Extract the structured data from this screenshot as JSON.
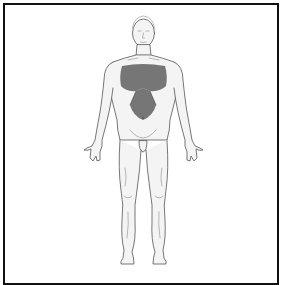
{
  "diagram": {
    "type": "anatomical-body-chart",
    "view": "anterior",
    "highlighted_regions": [
      {
        "name": "chest",
        "description": "shaded across upper anterior chest between shoulders"
      },
      {
        "name": "epigastric-upper-abdomen",
        "description": "shaded triangular extension down the midline to the umbilicus"
      }
    ],
    "colors": {
      "frame": "#111111",
      "background": "#ffffff",
      "body_fill": "#f4f4f4",
      "body_outline": "#555555",
      "shading": "#5f5f5f"
    },
    "text": []
  }
}
